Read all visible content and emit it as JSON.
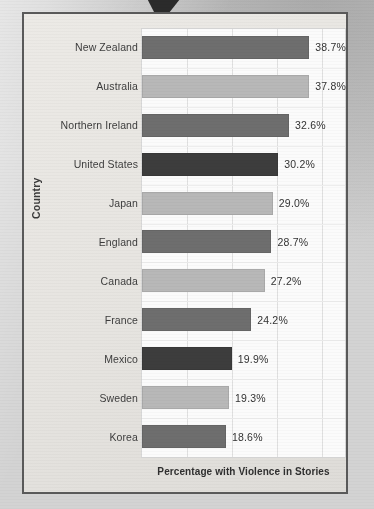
{
  "figure": {
    "arrow_icon": "down-arrow-pointer"
  },
  "chart_data": {
    "type": "bar",
    "orientation": "horizontal",
    "title": "",
    "xlabel": "Percentage with Violence in Stories",
    "ylabel": "Country",
    "categories": [
      "New Zealand",
      "Australia",
      "Northern Ireland",
      "United States",
      "Japan",
      "England",
      "Canada",
      "France",
      "Mexico",
      "Sweden",
      "Korea"
    ],
    "values": [
      38.7,
      37.8,
      32.6,
      30.2,
      29.0,
      28.7,
      27.2,
      24.2,
      19.9,
      19.3,
      18.6
    ],
    "value_labels": [
      "38.7%",
      "37.8%",
      "32.6%",
      "30.2%",
      "29.0%",
      "28.7%",
      "27.2%",
      "24.2%",
      "19.9%",
      "19.3%",
      "18.6%"
    ],
    "bar_colors": [
      "#6e6e6e",
      "#b8b8b8",
      "#6e6e6e",
      "#3d3d3d",
      "#b8b8b8",
      "#6e6e6e",
      "#b8b8b8",
      "#6e6e6e",
      "#3d3d3d",
      "#b8b8b8",
      "#6e6e6e"
    ],
    "xlim": [
      0,
      45
    ],
    "grid": true,
    "gridline_values": [
      0,
      10,
      20,
      30,
      40
    ],
    "legend": null
  }
}
